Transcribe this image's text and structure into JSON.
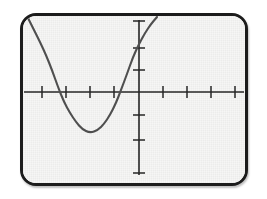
{
  "device": {
    "label": "graphing-calculator-screen",
    "frame_color": "#1c1c1c",
    "screen_color": "#f6f6f5"
  },
  "chart_data": {
    "type": "line",
    "title": "",
    "subtitle": "",
    "xlabel": "",
    "ylabel": "",
    "grid": false,
    "legend": false,
    "legend_position": "none",
    "axes": {
      "x_axis": {
        "visible": true,
        "position_px_y": 92,
        "start_px_x": 24,
        "end_px_x": 244,
        "tick_count": 8,
        "tick_positions_px": [
          42,
          66,
          90,
          114,
          163,
          187,
          211,
          235
        ],
        "tick_labels": [],
        "xlim": [
          -5,
          5
        ]
      },
      "y_axis": {
        "visible": true,
        "position_px_x": 139,
        "start_px_y": 20,
        "end_px_y": 175,
        "tick_count": 6,
        "tick_positions_px": [
          22,
          48,
          70,
          115,
          140,
          172
        ],
        "tick_labels": [],
        "ylim": [
          -4,
          4
        ]
      },
      "origin_px": [
        139,
        92
      ]
    },
    "series": [
      {
        "name": "parabola",
        "color": "#4f4f4f",
        "line_width": 2.1,
        "shape": "parabola-opening-up",
        "vertex_px": [
          90,
          133
        ],
        "x_intercepts_px": [
          60,
          120
        ],
        "y_intercept_px": 55,
        "points_px": [
          [
            28,
            18
          ],
          [
            34,
            30
          ],
          [
            40,
            42
          ],
          [
            46,
            55
          ],
          [
            52,
            70
          ],
          [
            58,
            87
          ],
          [
            64,
            102
          ],
          [
            70,
            113
          ],
          [
            76,
            122
          ],
          [
            82,
            129
          ],
          [
            90,
            133
          ],
          [
            98,
            130
          ],
          [
            104,
            124
          ],
          [
            110,
            115
          ],
          [
            116,
            103
          ],
          [
            121,
            90
          ],
          [
            127,
            74
          ],
          [
            133,
            57
          ],
          [
            139,
            44
          ],
          [
            145,
            33
          ],
          [
            151,
            24
          ],
          [
            157,
            17
          ]
        ]
      }
    ]
  }
}
